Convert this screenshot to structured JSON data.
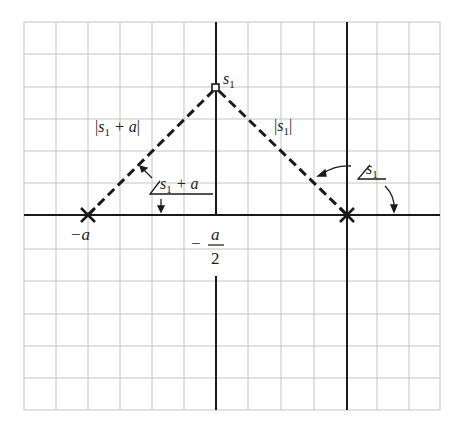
{
  "figure": {
    "type": "pole-zero root locus geometry",
    "colors": {
      "grid": "#c4c4c4",
      "axis": "#1a1a1a",
      "dashed": "#1a1a1a",
      "text": "#222222",
      "background": "#ffffff"
    },
    "grid": {
      "x_lines": [
        24,
        56,
        88,
        120,
        152,
        184,
        248,
        281,
        314,
        377,
        409,
        440
      ],
      "y_lines": [
        22,
        54,
        87,
        119,
        151,
        183,
        249,
        281,
        314,
        346,
        378,
        410
      ],
      "left": 24,
      "right": 440,
      "top": 22,
      "bottom": 410
    },
    "axes": {
      "real_axis_y": 215,
      "imag_axis_x": 216,
      "right_vertical_x": 347
    },
    "points": {
      "pole_left": {
        "symbol": "x",
        "x": 88,
        "y": 215,
        "label": "−a"
      },
      "pole_right": {
        "symbol": "x",
        "x": 347,
        "y": 215
      },
      "test_point": {
        "symbol": "square",
        "x": 216,
        "y": 88,
        "label_base": "s",
        "label_sub": "1"
      }
    },
    "labels": {
      "neg_a": "−a",
      "neg_a_over_2_minus": "−",
      "neg_a_over_2_num": "a",
      "neg_a_over_2_den": "2",
      "s1_base": "s",
      "s1_sub": "1",
      "mag_s1_plus_a": {
        "open": "|",
        "base": "s",
        "sub": "1",
        "rest": " + a",
        "close": "|"
      },
      "mag_s1": {
        "open": "|",
        "base": "s",
        "sub": "1",
        "close": "|"
      },
      "angle_s1_plus_a": {
        "base": "s",
        "sub": "1",
        "rest": " + a"
      },
      "angle_s1": {
        "base": "s",
        "sub": "1"
      }
    }
  }
}
